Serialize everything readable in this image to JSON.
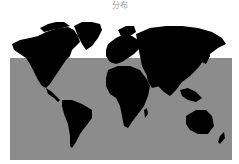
{
  "title": "分布",
  "map": {
    "projection": "equirectangular-world",
    "colors": {
      "land": "#000000",
      "ocean": "#8c8c8c",
      "background": "#ffffff",
      "title": "#999999"
    },
    "highlighted_region": "lower-latitudes band (gray backdrop)"
  }
}
